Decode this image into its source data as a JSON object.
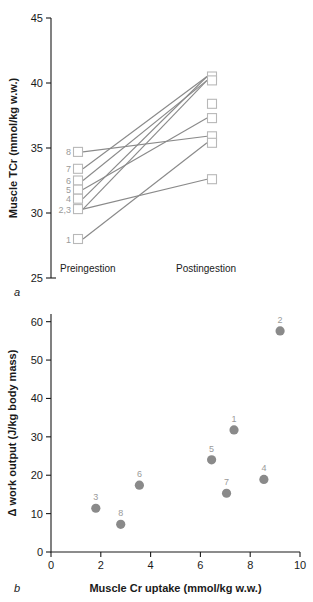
{
  "figure": {
    "panel_a_label": "a",
    "panel_b_label": "b"
  },
  "chart_data": [
    {
      "type": "line",
      "panel": "a",
      "title": "",
      "xlabel": "",
      "ylabel": "Muscle TCr (mmol/kg w.w.)",
      "categories": [
        "Preingestion",
        "Postingestion"
      ],
      "ylim": [
        25,
        45
      ],
      "yticks": [
        25,
        30,
        35,
        40,
        45
      ],
      "ytick_labels": [
        "25",
        "30",
        "35",
        "40",
        "45"
      ],
      "grid": false,
      "legend": "none",
      "marker": "open-square",
      "line_color": "#8a8a8a",
      "marker_color": "#b8b8b8",
      "series": [
        {
          "name": "1",
          "label": "1",
          "values": [
            28.0,
            35.4
          ]
        },
        {
          "name": "2",
          "label": "2,3",
          "values": [
            30.3,
            40.2
          ]
        },
        {
          "name": "3",
          "label": "2,3",
          "values": [
            30.3,
            32.6
          ]
        },
        {
          "name": "4",
          "label": "4",
          "values": [
            31.1,
            40.5
          ]
        },
        {
          "name": "5",
          "label": "5",
          "values": [
            31.8,
            37.3
          ]
        },
        {
          "name": "6",
          "label": "6",
          "values": [
            32.5,
            40.2
          ]
        },
        {
          "name": "7",
          "label": "7",
          "values": [
            33.4,
            40.5
          ]
        },
        {
          "name": "8",
          "label": "8",
          "values": [
            34.7,
            35.9
          ]
        }
      ],
      "pre_labels": [
        {
          "text": "8",
          "value": 34.7
        },
        {
          "text": "7",
          "value": 33.4
        },
        {
          "text": "6",
          "value": 32.5
        },
        {
          "text": "5",
          "value": 31.8
        },
        {
          "text": "4",
          "value": 31.1
        },
        {
          "text": "2,3",
          "value": 30.3
        },
        {
          "text": "1",
          "value": 28.0
        }
      ],
      "post_values": [
        40.5,
        40.2,
        38.4,
        37.3,
        35.9,
        35.4,
        32.6
      ]
    },
    {
      "type": "scatter",
      "panel": "b",
      "title": "",
      "xlabel": "Muscle Cr uptake (mmol/kg w.w.)",
      "ylabel": "Δ work output (J/kg body mass)",
      "xlim": [
        0,
        10
      ],
      "ylim": [
        0,
        62
      ],
      "xticks": [
        0,
        2,
        4,
        6,
        8,
        10
      ],
      "xtick_labels": [
        "0",
        "2",
        "4",
        "6",
        "8",
        "10"
      ],
      "yticks": [
        0,
        10,
        20,
        30,
        40,
        50,
        60
      ],
      "ytick_labels": [
        "0",
        "10",
        "20",
        "30",
        "40",
        "50",
        "60"
      ],
      "grid": false,
      "legend": "none",
      "marker": "filled-circle",
      "marker_color": "#8a8a8a",
      "points": [
        {
          "label": "1",
          "x": 7.35,
          "y": 31.8
        },
        {
          "label": "2",
          "x": 9.2,
          "y": 57.6
        },
        {
          "label": "3",
          "x": 1.8,
          "y": 11.4
        },
        {
          "label": "4",
          "x": 8.55,
          "y": 18.9
        },
        {
          "label": "5",
          "x": 6.45,
          "y": 24.0
        },
        {
          "label": "6",
          "x": 3.55,
          "y": 17.4
        },
        {
          "label": "7",
          "x": 7.05,
          "y": 15.3
        },
        {
          "label": "8",
          "x": 2.8,
          "y": 7.2
        }
      ]
    }
  ]
}
